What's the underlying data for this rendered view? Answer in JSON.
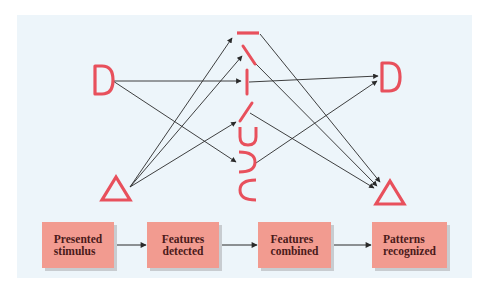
{
  "diagram": {
    "stroke_color": "#e8505c",
    "arrow_color": "#2a2a2a",
    "panel_color": "#edf5fa",
    "box_color": "#f29b90",
    "stimuli": [
      {
        "id": "stim-d",
        "label": "D",
        "shape": "letter-D"
      },
      {
        "id": "stim-tri",
        "label": "triangle",
        "shape": "triangle"
      }
    ],
    "features": [
      {
        "id": "feat-horizontal",
        "shape": "horizontal-line"
      },
      {
        "id": "feat-backslash",
        "shape": "diagonal-line-right-down"
      },
      {
        "id": "feat-vertical",
        "shape": "vertical-line"
      },
      {
        "id": "feat-slash",
        "shape": "diagonal-line-left-down"
      },
      {
        "id": "feat-u-curve",
        "shape": "u-curve"
      },
      {
        "id": "feat-reverse-c",
        "shape": "reverse-c-curve"
      },
      {
        "id": "feat-c",
        "shape": "c-curve"
      }
    ],
    "patterns": [
      {
        "id": "pat-d",
        "label": "D",
        "shape": "letter-D"
      },
      {
        "id": "pat-tri",
        "label": "triangle",
        "shape": "triangle"
      }
    ],
    "connections": [
      {
        "from": "stim-d",
        "to": "feat-vertical"
      },
      {
        "from": "stim-d",
        "to": "feat-reverse-c"
      },
      {
        "from": "stim-tri",
        "to": "feat-horizontal"
      },
      {
        "from": "stim-tri",
        "to": "feat-backslash"
      },
      {
        "from": "stim-tri",
        "to": "feat-slash"
      },
      {
        "from": "feat-horizontal",
        "to": "pat-tri"
      },
      {
        "from": "feat-backslash",
        "to": "pat-tri"
      },
      {
        "from": "feat-vertical",
        "to": "pat-d"
      },
      {
        "from": "feat-slash",
        "to": "pat-tri"
      },
      {
        "from": "feat-reverse-c",
        "to": "pat-d"
      }
    ],
    "stages": [
      {
        "label": "Presented\nstimulus"
      },
      {
        "label": "Features\ndetected"
      },
      {
        "label": "Features\ncombined"
      },
      {
        "label": "Patterns\nrecognized"
      }
    ]
  }
}
